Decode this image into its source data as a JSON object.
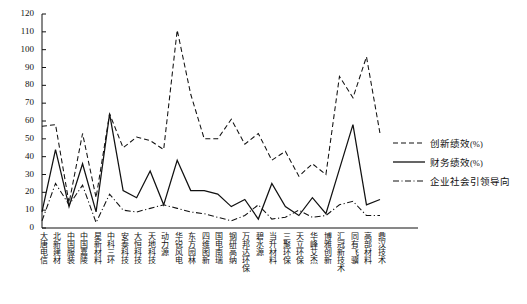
{
  "chart_data": {
    "type": "line",
    "title": "",
    "xlabel": "",
    "ylabel": "",
    "ylim": [
      0,
      120
    ],
    "ytick_step": 10,
    "yticks": [
      0,
      10,
      20,
      30,
      40,
      50,
      60,
      70,
      80,
      90,
      100,
      110,
      120
    ],
    "grid": false,
    "legend_position": "right",
    "categories": [
      "大唐电信",
      "北新建材",
      "中国服装",
      "中国嘉陵",
      "星新材料",
      "中科三环",
      "安泰科技",
      "大恒科技",
      "天地科技",
      "动力源",
      "华锐风电",
      "东方园林",
      "四维图新",
      "国电南瑞",
      "钢研高纳",
      "万邦达环保",
      "碧水源",
      "当升材料",
      "三聚环保",
      "天立环保",
      "华峰艾杰",
      "博雅创新",
      "汇冠新技术",
      "同有飞骥",
      "高部材料",
      "鼎汉技术"
    ],
    "series": [
      {
        "name": "创新绩效(%)",
        "style": "dashed",
        "color": "#111111",
        "values": [
          57,
          58,
          14,
          53,
          17,
          64,
          45,
          51,
          49,
          44,
          111,
          75,
          50,
          50,
          61,
          47,
          53,
          38,
          43,
          29,
          36,
          30,
          85,
          73,
          96,
          53
        ]
      },
      {
        "name": "财务绩效(%)",
        "style": "solid",
        "color": "#111111",
        "values": [
          9,
          44,
          12,
          36,
          9,
          64,
          21,
          17,
          32,
          13,
          38,
          21,
          21,
          19,
          12,
          16,
          5,
          25,
          12,
          7,
          17,
          8,
          33,
          58,
          13,
          16
        ]
      },
      {
        "name": "企业社会引领导向",
        "style": "dashdot",
        "color": "#111111",
        "values": [
          4,
          25,
          13,
          24,
          3,
          19,
          10,
          9,
          11,
          13,
          11,
          9,
          8,
          6,
          4,
          7,
          13,
          5,
          6,
          10,
          6,
          7,
          13,
          15,
          7,
          7
        ]
      }
    ]
  },
  "legend": {
    "items": [
      {
        "label": "创新绩效",
        "suffix": "(%)",
        "style": "dashed"
      },
      {
        "label": "财务绩效",
        "suffix": "(%)",
        "style": "solid"
      },
      {
        "label": "企业社会引领导向",
        "suffix": "",
        "style": "dashdot"
      }
    ]
  },
  "axes": {
    "y_min_label": "0",
    "y_max_label": "120"
  }
}
